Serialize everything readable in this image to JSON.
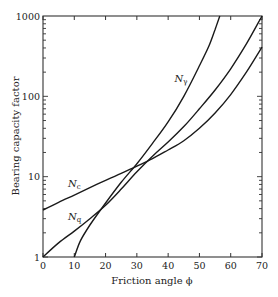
{
  "chart_data": {
    "type": "line",
    "title": "",
    "xlabel": "Friction angle ϕ",
    "ylabel": "Bearing capacity factor",
    "xlim": [
      0,
      70
    ],
    "ylim": [
      1,
      1000
    ],
    "yscale": "log",
    "grid": false,
    "legend": "none (inline curve labels)",
    "x_ticks": [
      0,
      10,
      20,
      30,
      40,
      50,
      60,
      70
    ],
    "x_tick_labels": [
      "0",
      "10",
      "20",
      "30",
      "40",
      "50",
      "60",
      "70"
    ],
    "y_ticks": [
      1,
      10,
      100,
      1000
    ],
    "y_tick_labels": [
      "1",
      "10",
      "100",
      "1000"
    ],
    "series": [
      {
        "name": "Nc",
        "label_main": "N",
        "label_sub": "c",
        "label_pos": [
          8,
          7.5
        ],
        "x": [
          0,
          5,
          10,
          15,
          20,
          25,
          30,
          35,
          40,
          45,
          50,
          55,
          60,
          65,
          70
        ],
        "values": [
          3.85,
          4.8,
          5.9,
          7.3,
          9.0,
          11.0,
          13.5,
          16.8,
          21.5,
          28,
          40,
          62,
          105,
          200,
          410
        ]
      },
      {
        "name": "Nq",
        "label_main": "N",
        "label_sub": "q",
        "label_pos": [
          8,
          2.9
        ],
        "x": [
          0,
          5,
          10,
          15,
          20,
          25,
          30,
          35,
          40,
          45,
          50,
          55,
          60,
          65,
          70
        ],
        "values": [
          1.0,
          1.5,
          2.1,
          3.0,
          4.4,
          7.0,
          11.5,
          18,
          27,
          42,
          70,
          120,
          220,
          450,
          1000
        ]
      },
      {
        "name": "Nγ",
        "label_main": "N",
        "label_sub": "γ",
        "label_pos": [
          42,
          150
        ],
        "x": [
          10,
          12,
          15,
          20,
          25,
          30,
          35,
          40,
          45,
          50,
          53,
          55,
          56.5
        ],
        "values": [
          1.0,
          1.6,
          2.5,
          4.7,
          8.5,
          14.5,
          26,
          48,
          100,
          240,
          420,
          680,
          1000
        ]
      }
    ]
  }
}
